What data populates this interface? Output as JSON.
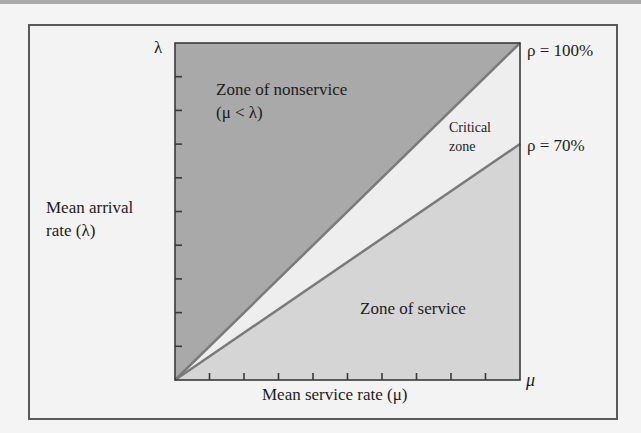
{
  "figure": {
    "y_axis_top_symbol": "λ",
    "x_axis_end_symbol": "μ",
    "y_axis_label_line1": "Mean arrival",
    "y_axis_label_line2": "rate (λ)",
    "x_axis_label": "Mean service rate (μ)",
    "zones": {
      "nonservice_line1": "Zone of nonservice",
      "nonservice_line2": "(μ < λ)",
      "critical_line1": "Critical",
      "critical_line2": "zone",
      "service": "Zone of service"
    },
    "lines": {
      "rho_100": "ρ = 100%",
      "rho_70": "ρ = 70%"
    },
    "colors": {
      "nonservice_fill": "#a9a9a9",
      "critical_fill": "#eeeeee",
      "service_fill": "#d5d5d5",
      "boundary_line": "#7a7a7a",
      "axis": "#3a3a3a"
    },
    "ticks_per_axis": 9
  }
}
